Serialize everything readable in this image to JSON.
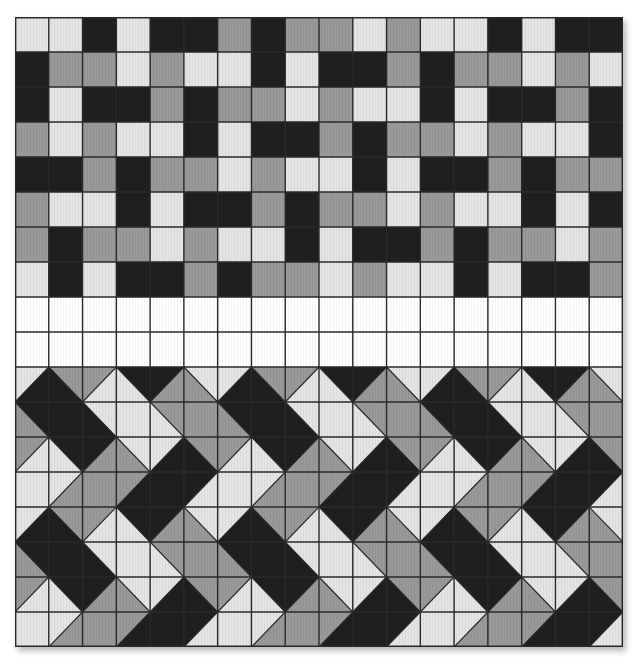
{
  "colors": {
    "L": "#e4e4e4",
    "G": "#999999",
    "B": "#1f1f1f",
    "W": "#ffffff",
    "line": "#2a2a2a"
  },
  "grid": {
    "cols": 18,
    "rows": 18,
    "cell_w": 33.78,
    "cell_h": 35
  },
  "top_section": {
    "rows": [
      "LLBLBBGBGGLGLLBLBB",
      "BGGLGLLBLBBGBGGLGL",
      "BLBBGBGGLGLLBLBBGB",
      "GLGLLBLBBGBGGLGLLB",
      "BBGBGGLGLLBLBBGBGG",
      "GLLBLBBGBGGLGLLBLB",
      "GBGGLGLLBLBBGBGGLG",
      "LBLBBGBGGLGLLBLBBG"
    ]
  },
  "blank_section": {
    "rows": 2,
    "color": "W"
  },
  "bottom_section": {
    "note": "each cell: diag '/' => [top-left color, bottom-right color]; '\\' => [top-right color, bottom-left color]; 'F' => full color",
    "period_cols": 6,
    "unit_rows": [
      [
        [
          "/",
          "L",
          "B"
        ],
        [
          "\\",
          "G",
          "B"
        ],
        [
          "/",
          "G",
          "L"
        ],
        [
          "\\",
          "B",
          "L"
        ],
        [
          "/",
          "B",
          "G"
        ],
        [
          "\\",
          "L",
          "G"
        ]
      ],
      [
        [
          "\\",
          "B",
          "G"
        ],
        [
          "F",
          "B"
        ],
        [
          "\\",
          "L",
          "B"
        ],
        [
          "F",
          "L"
        ],
        [
          "\\",
          "G",
          "L"
        ],
        [
          "F",
          "G"
        ]
      ],
      [
        [
          "/",
          "G",
          "L"
        ],
        [
          "\\",
          "B",
          "L"
        ],
        [
          "/",
          "B",
          "G"
        ],
        [
          "\\",
          "L",
          "G"
        ],
        [
          "/",
          "L",
          "B"
        ],
        [
          "\\",
          "G",
          "B"
        ]
      ],
      [
        [
          "F",
          "L"
        ],
        [
          "/",
          "L",
          "G"
        ],
        [
          "F",
          "G"
        ],
        [
          "/",
          "G",
          "B"
        ],
        [
          "F",
          "B"
        ],
        [
          "/",
          "B",
          "L"
        ]
      ]
    ],
    "repeat_rows": 2
  }
}
